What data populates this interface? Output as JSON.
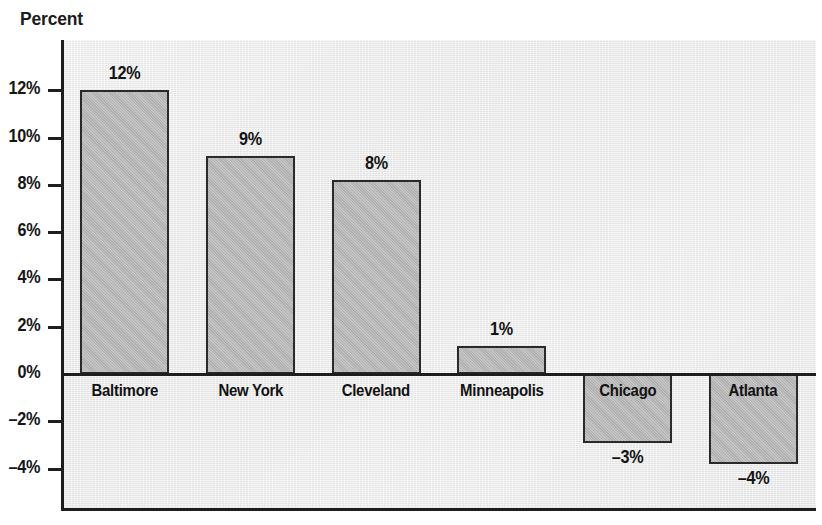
{
  "chart_data": {
    "type": "bar",
    "title": "Percent",
    "xlabel": "",
    "ylabel": "Percent",
    "categories": [
      "Baltimore",
      "New York",
      "Cleveland",
      "Minneapolis",
      "Chicago",
      "Atlanta"
    ],
    "values": [
      12,
      9.2,
      8.2,
      1.2,
      -2.9,
      -3.8
    ],
    "data_labels": [
      "12%",
      "9%",
      "8%",
      "1%",
      "–3%",
      "–4%"
    ],
    "ylim": [
      -5,
      13
    ],
    "y_ticks": [
      12,
      10,
      8,
      6,
      4,
      2,
      0,
      -2,
      -4
    ],
    "y_tick_labels": [
      "12%",
      "10%",
      "8%",
      "6%",
      "4%",
      "2%",
      "0%",
      "–2%",
      "–4%"
    ],
    "grid": false,
    "legend": false,
    "bar_color": "#b9b9b9",
    "bar_edge_color": "#2a2a2a",
    "plot_background": "#eaeaea",
    "text_color": "#141414"
  },
  "axis": {
    "caption": "Percent"
  }
}
